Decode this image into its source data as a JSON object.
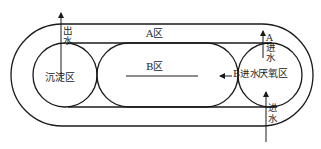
{
  "diagram": {
    "type": "process-flow",
    "zones": {
      "a_zone": "A区",
      "b_zone": "B区",
      "settling_zone": "沉淀区",
      "anaerobic_zone": "厌氧区"
    },
    "flows": {
      "outlet_char1": "出",
      "outlet_char2": "水",
      "a_inlet_char1": "A",
      "a_inlet_char2": "进",
      "a_inlet_char3": "水",
      "b_inlet": "B进水",
      "inlet_char1": "进",
      "inlet_char2": "水"
    }
  }
}
